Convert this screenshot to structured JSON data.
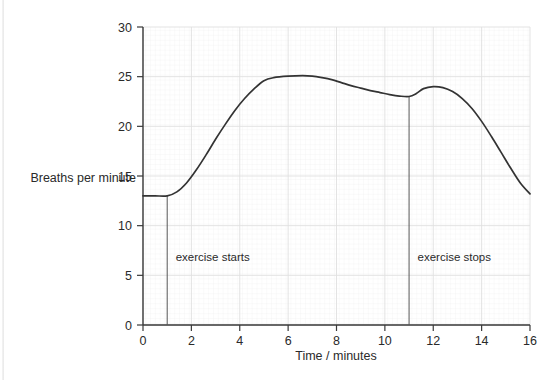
{
  "chart_data": {
    "type": "line",
    "title": "",
    "xlabel": "Time / minutes",
    "ylabel": "Breaths per minute",
    "xlim": [
      0,
      16
    ],
    "ylim": [
      0,
      30
    ],
    "xticks": [
      0,
      2,
      4,
      6,
      8,
      10,
      12,
      14,
      16
    ],
    "xtick_labels": [
      "0",
      "2",
      "4",
      "6",
      "8",
      "10",
      "12",
      "14",
      "16"
    ],
    "yticks": [
      0,
      5,
      10,
      15,
      20,
      25,
      30
    ],
    "ytick_labels": [
      "0",
      "5",
      "10",
      "15",
      "20",
      "25",
      "30"
    ],
    "grid": true,
    "grid_minor": true,
    "legend": null,
    "series": [
      {
        "name": "breathing rate",
        "color": "#333333",
        "x": [
          0.0,
          0.5,
          1.0,
          1.4,
          1.8,
          2.2,
          2.6,
          3.0,
          3.4,
          3.8,
          4.2,
          4.6,
          5.0,
          5.4,
          6.0,
          6.6,
          7.0,
          7.4,
          7.8,
          8.2,
          8.6,
          9.0,
          9.4,
          9.8,
          10.2,
          10.6,
          11.0,
          11.3,
          11.6,
          12.0,
          12.4,
          12.8,
          13.2,
          13.6,
          14.0,
          14.4,
          14.8,
          15.2,
          15.6,
          16.0
        ],
        "y": [
          13.0,
          13.0,
          13.0,
          13.4,
          14.3,
          15.6,
          17.1,
          18.7,
          20.2,
          21.6,
          22.8,
          23.8,
          24.6,
          24.9,
          25.05,
          25.1,
          25.05,
          24.9,
          24.7,
          24.4,
          24.1,
          23.85,
          23.6,
          23.4,
          23.2,
          23.05,
          23.0,
          23.3,
          23.8,
          24.0,
          23.9,
          23.5,
          22.8,
          21.8,
          20.5,
          19.0,
          17.4,
          15.8,
          14.3,
          13.2
        ]
      }
    ],
    "annotations": [
      {
        "id": "exercise-starts",
        "label": "exercise starts",
        "x": 1,
        "line_from_y": 0,
        "line_to_y": 13,
        "label_x": 1.35,
        "label_y": 6.4
      },
      {
        "id": "exercise-stops",
        "label": "exercise stops",
        "x": 11,
        "line_from_y": 0,
        "line_to_y": 23,
        "label_x": 11.35,
        "label_y": 6.4
      }
    ],
    "colors": {
      "curve": "#333333",
      "axis": "#3a3a3a",
      "grid_major": "#e0e0e0",
      "grid_minor": "#f0f0f0",
      "text": "#2a2a2a",
      "background": "#ffffff"
    }
  }
}
